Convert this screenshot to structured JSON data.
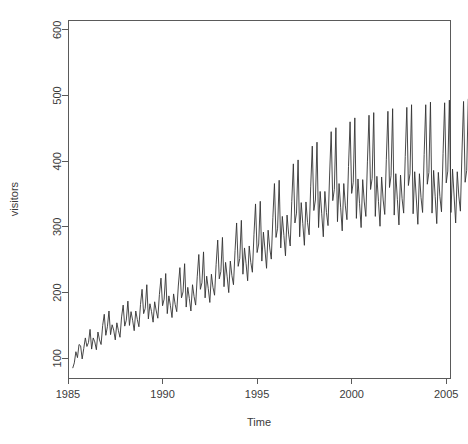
{
  "chart_data": {
    "type": "line",
    "title": "",
    "subtitle": "",
    "xlabel": "Time",
    "ylabel": "visitors",
    "grid": false,
    "legend": "none",
    "line_color": "#333333",
    "xlim": [
      1985.0,
      2005.2
    ],
    "ylim": [
      70,
      615
    ],
    "xticks": [
      1985,
      1990,
      1995,
      2000,
      2005
    ],
    "xticklabels": [
      "1985",
      "1990",
      "1995",
      "2000",
      "2005"
    ],
    "yticks": [
      100,
      200,
      300,
      400,
      500,
      600
    ],
    "yticklabels": [
      "100",
      "200",
      "300",
      "400",
      "500",
      "600"
    ],
    "x_start": 1985.25,
    "x_step": 0.0833333,
    "series": [
      {
        "name": "visitors",
        "values": [
          85,
          93,
          110,
          101,
          121,
          119,
          99,
          115,
          131,
          118,
          124,
          144,
          114,
          131,
          125,
          113,
          140,
          128,
          121,
          150,
          167,
          135,
          148,
          172,
          136,
          151,
          143,
          128,
          154,
          142,
          132,
          163,
          181,
          149,
          158,
          187,
          150,
          171,
          158,
          142,
          172,
          159,
          148,
          182,
          205,
          168,
          176,
          212,
          160,
          183,
          171,
          155,
          186,
          172,
          161,
          197,
          222,
          180,
          190,
          229,
          168,
          195,
          180,
          162,
          198,
          182,
          171,
          210,
          238,
          192,
          201,
          244,
          178,
          208,
          191,
          172,
          212,
          194,
          181,
          224,
          258,
          205,
          215,
          262,
          192,
          225,
          206,
          185,
          228,
          208,
          196,
          243,
          280,
          221,
          232,
          284,
          209,
          246,
          224,
          200,
          248,
          226,
          212,
          264,
          306,
          240,
          252,
          310,
          228,
          268,
          244,
          218,
          271,
          246,
          231,
          288,
          335,
          261,
          274,
          339,
          248,
          292,
          265,
          237,
          295,
          268,
          251,
          314,
          366,
          284,
          298,
          371,
          268,
          316,
          287,
          256,
          318,
          289,
          271,
          339,
          396,
          306,
          321,
          402,
          285,
          337,
          305,
          272,
          338,
          307,
          288,
          361,
          423,
          325,
          341,
          429,
          299,
          354,
          320,
          285,
          354,
          322,
          302,
          379,
          445,
          340,
          357,
          451,
          308,
          366,
          330,
          294,
          366,
          332,
          311,
          392,
          460,
          351,
          368,
          466,
          313,
          373,
          336,
          299,
          372,
          338,
          316,
          399,
          470,
          357,
          374,
          474,
          316,
          377,
          339,
          301,
          376,
          341,
          319,
          403,
          476,
          360,
          378,
          480,
          318,
          381,
          342,
          303,
          379,
          343,
          321,
          407,
          482,
          363,
          381,
          486,
          320,
          384,
          344,
          304,
          381,
          345,
          322,
          410,
          486,
          365,
          383,
          490,
          321,
          386,
          346,
          305,
          383,
          346,
          323,
          412,
          489,
          367,
          385,
          493,
          322,
          388,
          347,
          306,
          384,
          347,
          324,
          414,
          491,
          368,
          386,
          495
        ],
        "peaks": [
          {
            "year": 1996.92,
            "value": 468
          },
          {
            "year": 2000.92,
            "value": 562
          },
          {
            "year": 2002.92,
            "value": 540
          },
          {
            "year": 2004.92,
            "value": 590
          }
        ],
        "troughs": [
          {
            "year": 1985.25,
            "value": 85
          },
          {
            "year": 2003.42,
            "value": 258
          }
        ],
        "min": 85,
        "max": 590,
        "n_points": 252
      }
    ]
  },
  "axes": {
    "x_title": "Time",
    "y_title": "visitors",
    "x_tick_labels": [
      "1985",
      "1990",
      "1995",
      "2000",
      "2005"
    ],
    "y_tick_labels": [
      "100",
      "200",
      "300",
      "400",
      "500",
      "600"
    ]
  }
}
